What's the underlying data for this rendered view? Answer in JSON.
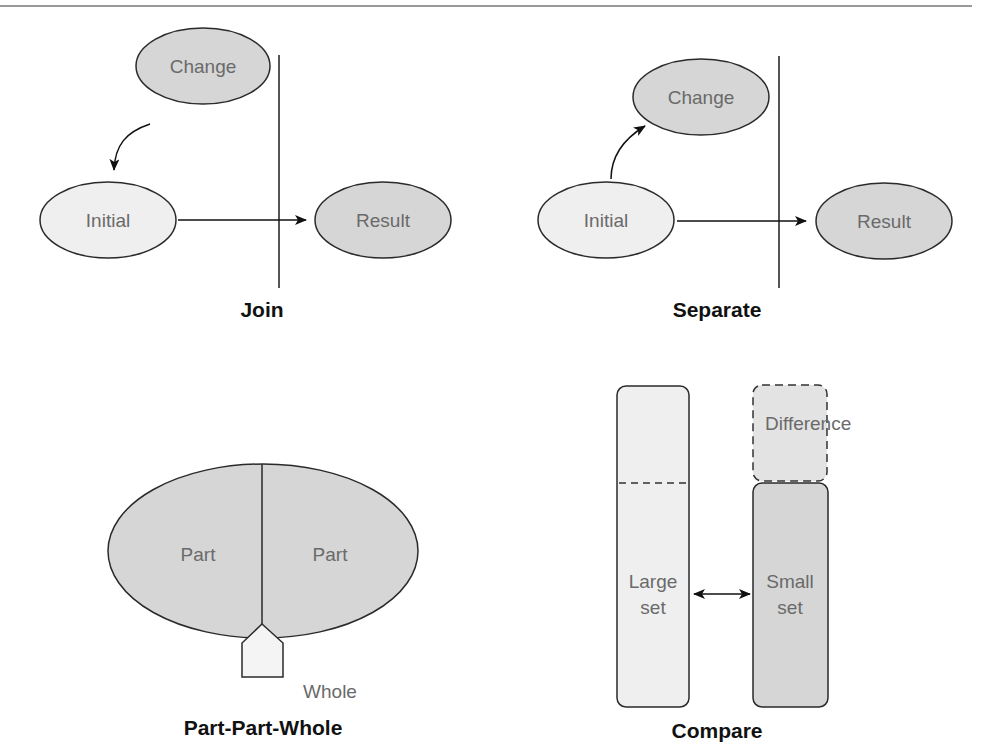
{
  "colors": {
    "dark_fill": "#d6d6d6",
    "light_fill": "#efefef",
    "stroke": "#2a2a2a",
    "divider": "#555555",
    "label_text": "#6a6a6a",
    "title_text": "#111111"
  },
  "diagrams": {
    "join": {
      "title": "Join",
      "nodes": {
        "change": "Change",
        "initial": "Initial",
        "result": "Result"
      }
    },
    "separate": {
      "title": "Separate",
      "nodes": {
        "change": "Change",
        "initial": "Initial",
        "result": "Result"
      }
    },
    "part_part_whole": {
      "title": "Part-Part-Whole",
      "parts": [
        "Part",
        "Part"
      ],
      "whole": "Whole"
    },
    "compare": {
      "title": "Compare",
      "large_set": [
        "Large",
        "set"
      ],
      "small_set": [
        "Small",
        "set"
      ],
      "difference": "Difference"
    }
  }
}
